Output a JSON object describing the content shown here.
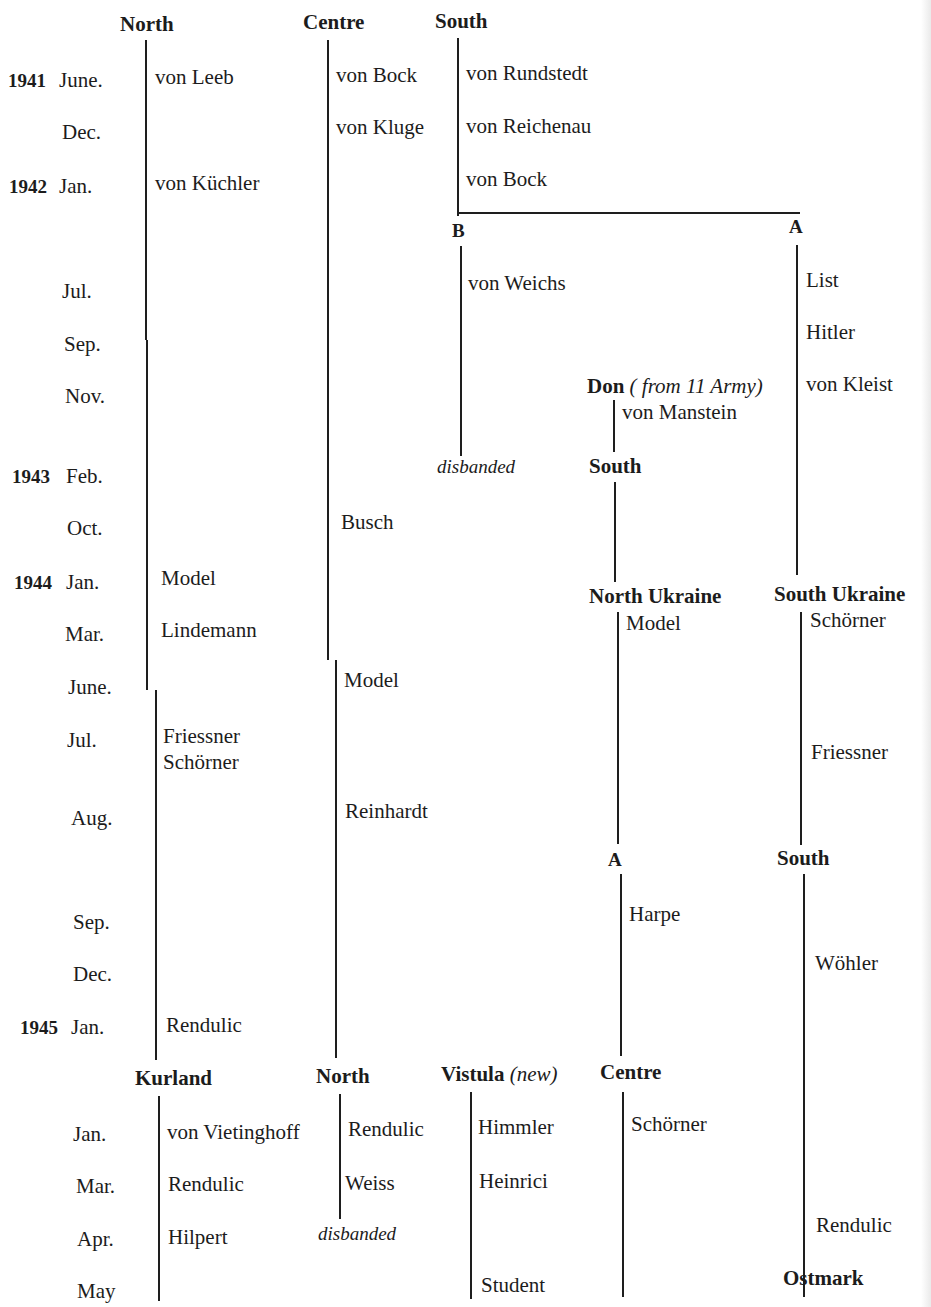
{
  "diagram": {
    "type": "timeline-tree",
    "headers": {
      "north": "North",
      "centre": "Centre",
      "south": "South",
      "b": "B",
      "a": "A",
      "don": "Don",
      "don_note": "( from 11 Army)",
      "south_2": "South",
      "north_ukraine": "North Ukraine",
      "south_ukraine": "South Ukraine",
      "a_2": "A",
      "south_3": "South",
      "kurland": "Kurland",
      "north_2": "North",
      "vistula": "Vistula",
      "vistula_note": "(new)",
      "centre_2": "Centre",
      "ostmark": "Ostmark"
    },
    "dates": [
      {
        "year": "1941",
        "month": "June."
      },
      {
        "year": "",
        "month": "Dec."
      },
      {
        "year": "1942",
        "month": "Jan."
      },
      {
        "year": "",
        "month": "Jul."
      },
      {
        "year": "",
        "month": "Sep."
      },
      {
        "year": "",
        "month": "Nov."
      },
      {
        "year": "1943",
        "month": "Feb."
      },
      {
        "year": "",
        "month": "Oct."
      },
      {
        "year": "1944",
        "month": "Jan."
      },
      {
        "year": "",
        "month": "Mar."
      },
      {
        "year": "",
        "month": "June."
      },
      {
        "year": "",
        "month": "Jul."
      },
      {
        "year": "",
        "month": "Aug."
      },
      {
        "year": "",
        "month": "Sep."
      },
      {
        "year": "",
        "month": "Dec."
      },
      {
        "year": "1945",
        "month": "Jan."
      },
      {
        "year": "",
        "month": "Jan."
      },
      {
        "year": "",
        "month": "Mar."
      },
      {
        "year": "",
        "month": "Apr."
      },
      {
        "year": "",
        "month": "May"
      }
    ],
    "commanders": {
      "north": [
        "von Leeb",
        "von Küchler",
        "Model",
        "Lindemann",
        "Friessner",
        "Schörner",
        "Rendulic"
      ],
      "centre": [
        "von Bock",
        "von Kluge",
        "Busch",
        "Model",
        "Reinhardt"
      ],
      "south": [
        "von Rundstedt",
        "von Reichenau",
        "von Bock"
      ],
      "b": [
        "von Weichs"
      ],
      "b_end": "disbanded",
      "a": [
        "List",
        "Hitler",
        "von Kleist"
      ],
      "don": [
        "von Manstein"
      ],
      "north_ukraine": [
        "Model"
      ],
      "south_ukraine": [
        "Schörner",
        "Friessner"
      ],
      "a_2": [
        "Harpe"
      ],
      "south_3": [
        "Wöhler",
        "Rendulic"
      ],
      "kurland": [
        "von Vietinghoff",
        "Rendulic",
        "Hilpert"
      ],
      "north_2": [
        "Rendulic",
        "Weiss"
      ],
      "north_2_end": "disbanded",
      "vistula": [
        "Himmler",
        "Heinrici",
        "Student"
      ],
      "centre_2": [
        "Schörner"
      ]
    }
  }
}
